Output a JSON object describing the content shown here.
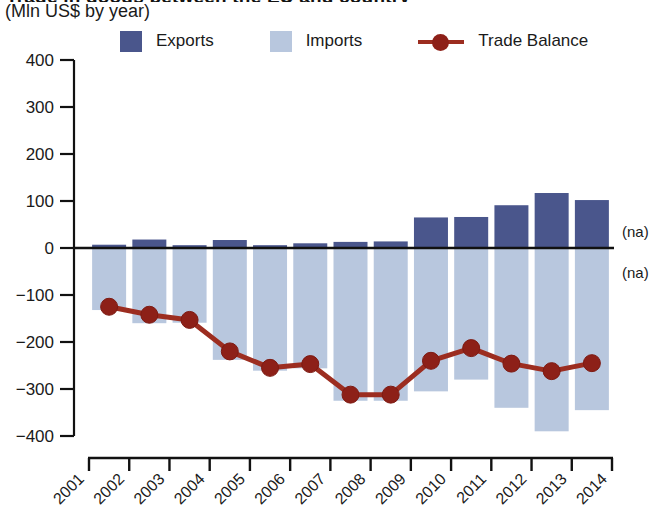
{
  "header": {
    "title_clipped": "Trade in goods between the EU and country",
    "subtitle": "(Mln US$ by year)"
  },
  "legend": {
    "position": "top",
    "items": [
      {
        "label": "Exports",
        "type": "bar",
        "color": "#4a568c"
      },
      {
        "label": "Imports",
        "type": "bar",
        "color": "#b8c7de"
      },
      {
        "label": "Trade Balance",
        "type": "line",
        "color": "#9c2d20"
      }
    ]
  },
  "annotations": {
    "na_above": "(na)",
    "na_below": "(na)"
  },
  "chart_data": {
    "type": "bar",
    "title": "Trade in goods between the EU and country",
    "subtitle": "(Mln US$ by year)",
    "xlabel": "",
    "ylabel": "Mln US$",
    "ylim": [
      -400,
      400
    ],
    "yticks": [
      400,
      300,
      200,
      100,
      0,
      -100,
      -200,
      -300,
      -400
    ],
    "ytick_labels": [
      "400",
      "300",
      "200",
      "100",
      "0",
      "-100",
      "-200",
      "-300",
      "-400"
    ],
    "xticks": [
      "2001",
      "2002",
      "2003",
      "2004",
      "2005",
      "2006",
      "2007",
      "2008",
      "2009",
      "2010",
      "2011",
      "2012",
      "2013",
      "2014"
    ],
    "categories": [
      "2001",
      "2002",
      "2003",
      "2004",
      "2005",
      "2006",
      "2007",
      "2008",
      "2009",
      "2010",
      "2011",
      "2012",
      "2013"
    ],
    "grid": false,
    "legend_position": "top",
    "series": [
      {
        "name": "Exports",
        "type": "bar",
        "color": "#4a568c",
        "values": [
          7,
          18,
          6,
          17,
          6,
          10,
          13,
          14,
          65,
          66,
          91,
          117,
          102
        ]
      },
      {
        "name": "Imports",
        "type": "bar",
        "color": "#b8c7de",
        "note": "plotted as negative (below axis)",
        "values": [
          -132,
          -160,
          -159,
          -238,
          -261,
          -256,
          -325,
          -325,
          -305,
          -280,
          -340,
          -390,
          -345
        ]
      },
      {
        "name": "Trade Balance",
        "type": "line",
        "color": "#9c2d20",
        "values": [
          -125,
          -142,
          -153,
          -220,
          -255,
          -247,
          -312,
          -312,
          -240,
          -213,
          -246,
          -262,
          -245
        ]
      }
    ],
    "annotations": [
      "(na)",
      "(na)"
    ]
  }
}
